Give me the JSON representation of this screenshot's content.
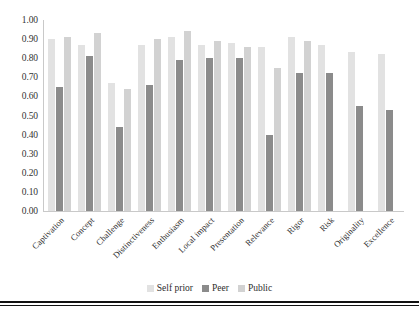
{
  "chart_data": {
    "type": "bar",
    "title": "",
    "xlabel": "",
    "ylabel": "",
    "ylim": [
      0.0,
      1.0
    ],
    "ytick_step": 0.1,
    "grid": false,
    "legend_position": "bottom",
    "categories": [
      "Captivation",
      "Concept",
      "Challenge",
      "Distinctiveness",
      "Enthusiasm",
      "Local impact",
      "Presentation",
      "Relevance",
      "Rigor",
      "Risk",
      "Originality",
      "Excellence"
    ],
    "ytick_labels": [
      "1.00",
      "0.90",
      "0.80",
      "0.70",
      "0.60",
      "0.50",
      "0.40",
      "0.30",
      "0.20",
      "0.10",
      "0.00"
    ],
    "ytick_values": [
      1.0,
      0.9,
      0.8,
      0.7,
      0.6,
      0.5,
      0.4,
      0.3,
      0.2,
      0.1,
      0.0
    ],
    "series": [
      {
        "name": "Self prior",
        "color": "#e2e2e2",
        "values": [
          0.9,
          0.87,
          0.67,
          0.87,
          0.91,
          0.87,
          0.88,
          0.86,
          0.91,
          0.87,
          0.83,
          0.82
        ]
      },
      {
        "name": "Peer",
        "color": "#8b8b8b",
        "values": [
          0.65,
          0.81,
          0.44,
          0.66,
          0.79,
          0.8,
          0.8,
          0.4,
          0.72,
          0.72,
          0.55,
          0.53
        ]
      },
      {
        "name": "Public",
        "color": "#d2d2d2",
        "values": [
          0.91,
          0.93,
          0.64,
          0.9,
          0.94,
          0.89,
          0.86,
          0.75,
          0.89,
          null,
          null,
          null
        ]
      }
    ]
  },
  "legend": {
    "items": [
      {
        "label": "Self prior",
        "key": "self"
      },
      {
        "label": "Peer",
        "key": "peer"
      },
      {
        "label": "Public",
        "key": "public"
      }
    ]
  },
  "colors": {
    "self_prior": "#e2e2e2",
    "peer": "#8b8b8b",
    "public": "#d2d2d2",
    "axis": "#c9c9c9",
    "rule": "#111111",
    "background": "#ffffff"
  }
}
